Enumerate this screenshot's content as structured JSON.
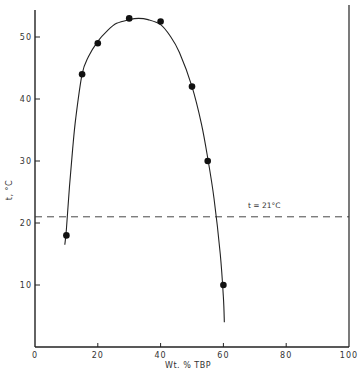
{
  "chart_data": {
    "type": "scatter",
    "title": "",
    "xlabel": "Wt. % TBP",
    "ylabel": "t, °C",
    "xlim": [
      0,
      100
    ],
    "ylim": [
      0,
      55
    ],
    "xticks": [
      0,
      20,
      40,
      60,
      80,
      100
    ],
    "xtick_labels": [
      "0",
      "20",
      "40",
      "60",
      "80",
      "100"
    ],
    "yticks": [
      10,
      20,
      30,
      40,
      50
    ],
    "ytick_labels": [
      "10",
      "20",
      "30",
      "40",
      "50"
    ],
    "grid": false,
    "legend": null,
    "series": [
      {
        "name": "measured points",
        "kind": "scatter",
        "x": [
          10,
          15,
          20,
          30,
          40,
          50,
          55,
          60
        ],
        "y": [
          18,
          44,
          49,
          53,
          52.5,
          42,
          30,
          10
        ]
      },
      {
        "name": "fitted curve",
        "kind": "line",
        "x": [
          9.5,
          10,
          11,
          12,
          13,
          15,
          17,
          20,
          23,
          26,
          30,
          33,
          36,
          40,
          43,
          46,
          50,
          53,
          55,
          57,
          59,
          60,
          60.3
        ],
        "y": [
          16.5,
          19,
          26,
          32,
          37,
          44,
          46.8,
          49.3,
          51,
          52.2,
          52.8,
          53,
          52.8,
          52,
          50.2,
          47.5,
          42,
          36,
          30.5,
          24,
          15,
          8,
          4
        ]
      }
    ],
    "reference_lines": [
      {
        "orientation": "horizontal",
        "y": 21,
        "style": "dashed",
        "label": "t = 21°C"
      }
    ],
    "annotations": [
      {
        "text": "t = 21°C",
        "x": 73,
        "y": 22.5
      }
    ]
  }
}
